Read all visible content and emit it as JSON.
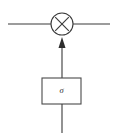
{
  "diagram": {
    "background_color": "#ffffff",
    "stroke_color": "#3a3a3a",
    "box_stroke_color": "#4a4a4a",
    "arrow_fill_color": "#2e2e2e",
    "operator": {
      "name": "multiplication",
      "symbol": "×",
      "icon": "multiply-circle-icon",
      "center_x": 62,
      "center_y": 24,
      "radius": 11
    },
    "gate": {
      "label": "σ",
      "icon": "sigma-gate-icon",
      "box_x": 42,
      "box_y": 78,
      "box_width": 39,
      "box_height": 26,
      "label_x": 61.5,
      "label_y": 91.5
    },
    "signal_line": {
      "name": "horizontal-signal-line",
      "x_start": 8,
      "x_end": 110,
      "y": 24
    },
    "gate_output_arrow": {
      "name": "gate-to-multiplier-arrow",
      "x": 62,
      "y_start": 78,
      "y_end": 37,
      "head_width": 7,
      "head_height": 10
    },
    "gate_input_line": {
      "name": "gate-input-line",
      "x": 62,
      "y_start": 104,
      "y_end": 133
    }
  }
}
